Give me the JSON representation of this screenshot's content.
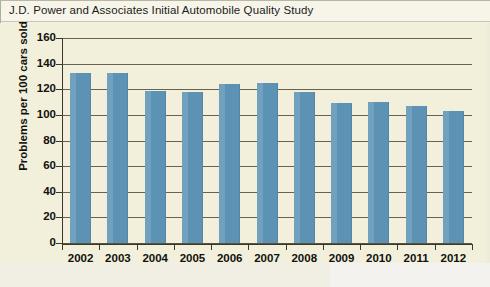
{
  "caption": {
    "text": "J.D. Power and Associates Initial Automobile Quality Study"
  },
  "colors": {
    "bar": "#5c93b5",
    "plot_background": "#f2efda",
    "axis": "#3c382c",
    "caption_background": "#f7f5ea"
  },
  "chart_data": {
    "type": "bar",
    "title": "J.D. Power and Associates Initial Automobile Quality Study",
    "categories": [
      "2002",
      "2003",
      "2004",
      "2005",
      "2006",
      "2007",
      "2008",
      "2009",
      "2010",
      "2011",
      "2012"
    ],
    "values": [
      133,
      133,
      119,
      118,
      124,
      125,
      118,
      109,
      110,
      107,
      103
    ],
    "xlabel": "Year",
    "ylabel": "Problems per 100 cars sold",
    "ylim": [
      0,
      160
    ],
    "ytick_step": 20,
    "yticks": [
      "0",
      "20",
      "40",
      "60",
      "80",
      "100",
      "120",
      "140",
      "160"
    ],
    "grid": true,
    "legend": "none"
  }
}
